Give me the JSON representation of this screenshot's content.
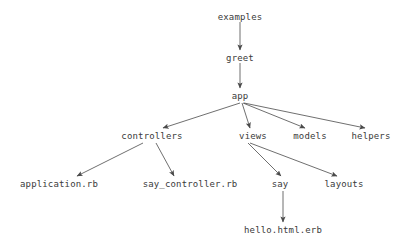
{
  "diagram": {
    "background_color": "#ffffff",
    "text_color": "#3a3a3a",
    "edge_color": "#4a4a4a",
    "nodes": [
      {
        "id": "examples",
        "label": "examples",
        "x": 240,
        "y": 17
      },
      {
        "id": "greet",
        "label": "greet",
        "x": 240,
        "y": 58
      },
      {
        "id": "app",
        "label": "app",
        "x": 240,
        "y": 96
      },
      {
        "id": "controllers",
        "label": "controllers",
        "x": 152,
        "y": 136
      },
      {
        "id": "views",
        "label": "views",
        "x": 253,
        "y": 136
      },
      {
        "id": "models",
        "label": "models",
        "x": 310,
        "y": 136
      },
      {
        "id": "helpers",
        "label": "helpers",
        "x": 371,
        "y": 136
      },
      {
        "id": "application_rb",
        "label": "application.rb",
        "x": 59,
        "y": 184
      },
      {
        "id": "say_controller_rb",
        "label": "say_controller.rb",
        "x": 190,
        "y": 184
      },
      {
        "id": "say",
        "label": "say",
        "x": 280,
        "y": 184
      },
      {
        "id": "layouts",
        "label": "layouts",
        "x": 344,
        "y": 184
      },
      {
        "id": "hello_html_erb",
        "label": "hello.html.erb",
        "x": 283,
        "y": 230
      }
    ],
    "edges": [
      {
        "from": "examples",
        "to": "greet",
        "x1": 240,
        "y1": 22,
        "x2": 240,
        "y2": 50
      },
      {
        "from": "greet",
        "to": "app",
        "x1": 240,
        "y1": 63,
        "x2": 240,
        "y2": 88
      },
      {
        "from": "app",
        "to": "controllers",
        "x1": 240,
        "y1": 103,
        "x2": 163,
        "y2": 128
      },
      {
        "from": "app",
        "to": "views",
        "x1": 242,
        "y1": 103,
        "x2": 250,
        "y2": 128
      },
      {
        "from": "app",
        "to": "models",
        "x1": 243,
        "y1": 103,
        "x2": 305,
        "y2": 128
      },
      {
        "from": "app",
        "to": "helpers",
        "x1": 244,
        "y1": 103,
        "x2": 365,
        "y2": 128
      },
      {
        "from": "controllers",
        "to": "application_rb",
        "x1": 143,
        "y1": 143,
        "x2": 77,
        "y2": 176
      },
      {
        "from": "controllers",
        "to": "say_controller_rb",
        "x1": 156,
        "y1": 143,
        "x2": 174,
        "y2": 176
      },
      {
        "from": "views",
        "to": "say",
        "x1": 248,
        "y1": 143,
        "x2": 281,
        "y2": 176
      },
      {
        "from": "views",
        "to": "layouts",
        "x1": 250,
        "y1": 143,
        "x2": 337,
        "y2": 176
      },
      {
        "from": "say",
        "to": "hello_html_erb",
        "x1": 283,
        "y1": 191,
        "x2": 283,
        "y2": 222
      }
    ]
  }
}
